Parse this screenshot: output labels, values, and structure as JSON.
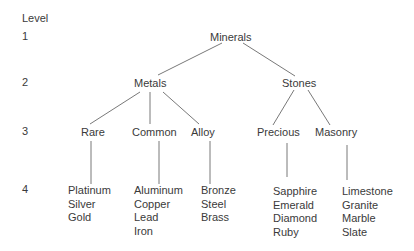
{
  "diagram": {
    "type": "hierarchy-tree",
    "level_header": "Level",
    "levels": [
      "1",
      "2",
      "3",
      "4"
    ],
    "root": {
      "label": "Minerals",
      "children": [
        {
          "label": "Metals",
          "children": [
            {
              "label": "Rare",
              "leaves": [
                "Platinum",
                "Silver",
                "Gold"
              ]
            },
            {
              "label": "Common",
              "leaves": [
                "Aluminum",
                "Copper",
                "Lead",
                "Iron"
              ]
            },
            {
              "label": "Alloy",
              "leaves": [
                "Bronze",
                "Steel",
                "Brass"
              ]
            }
          ]
        },
        {
          "label": "Stones",
          "children": [
            {
              "label": "Precious",
              "leaves": [
                "Sapphire",
                "Emerald",
                "Diamond",
                "Ruby"
              ]
            },
            {
              "label": "Masonry",
              "leaves": [
                "Limestone",
                "Granite",
                "Marble",
                "Slate"
              ]
            }
          ]
        }
      ]
    }
  }
}
